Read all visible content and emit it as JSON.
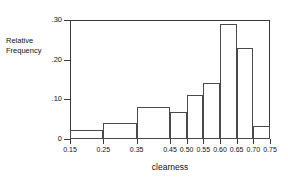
{
  "chart_data": {
    "type": "bar",
    "title": "",
    "xlabel": "clearness",
    "ylabel": "Relative Frequency",
    "ylabel_lines": [
      "Relative",
      "Frequency"
    ],
    "grid": false,
    "legend": "none",
    "xlim": [
      0.15,
      0.75
    ],
    "ylim": [
      0,
      0.3
    ],
    "ytick_labels": [
      ".30",
      ".20",
      ".10",
      "0"
    ],
    "ytick_values": [
      0.3,
      0.2,
      0.1,
      0.0
    ],
    "xtick_labels": [
      "0.15",
      "0.25",
      "0.35",
      "0.45",
      "0.50",
      "0.55",
      "0.60",
      "0.65",
      "0.70",
      "0.75"
    ],
    "xtick_values": [
      0.15,
      0.25,
      0.35,
      0.45,
      0.5,
      0.55,
      0.6,
      0.65,
      0.7,
      0.75
    ],
    "bins": [
      {
        "label": "0.15-0.25",
        "left": 0.15,
        "right": 0.25,
        "value": 0.022
      },
      {
        "label": "0.25-0.35",
        "left": 0.25,
        "right": 0.35,
        "value": 0.04
      },
      {
        "label": "0.35-0.45",
        "left": 0.35,
        "right": 0.45,
        "value": 0.08
      },
      {
        "label": "0.45-0.50",
        "left": 0.45,
        "right": 0.5,
        "value": 0.067
      },
      {
        "label": "0.50-0.55",
        "left": 0.5,
        "right": 0.55,
        "value": 0.11
      },
      {
        "label": "0.55-0.60",
        "left": 0.55,
        "right": 0.6,
        "value": 0.14
      },
      {
        "label": "0.60-0.65",
        "left": 0.6,
        "right": 0.65,
        "value": 0.29
      },
      {
        "label": "0.65-0.70",
        "left": 0.65,
        "right": 0.7,
        "value": 0.23
      },
      {
        "label": "0.70-0.75",
        "left": 0.7,
        "right": 0.75,
        "value": 0.033
      }
    ],
    "categories": [
      "0.15-0.25",
      "0.25-0.35",
      "0.35-0.45",
      "0.45-0.50",
      "0.50-0.55",
      "0.55-0.60",
      "0.60-0.65",
      "0.65-0.70",
      "0.70-0.75"
    ],
    "values": [
      0.022,
      0.04,
      0.08,
      0.067,
      0.11,
      0.14,
      0.29,
      0.23,
      0.033
    ],
    "colors": {
      "bar_fill": "#ffffff",
      "bar_stroke": "#4a4a4a",
      "axis": "#3a3a3a",
      "text": "#111111",
      "background": "#ffffff"
    }
  }
}
